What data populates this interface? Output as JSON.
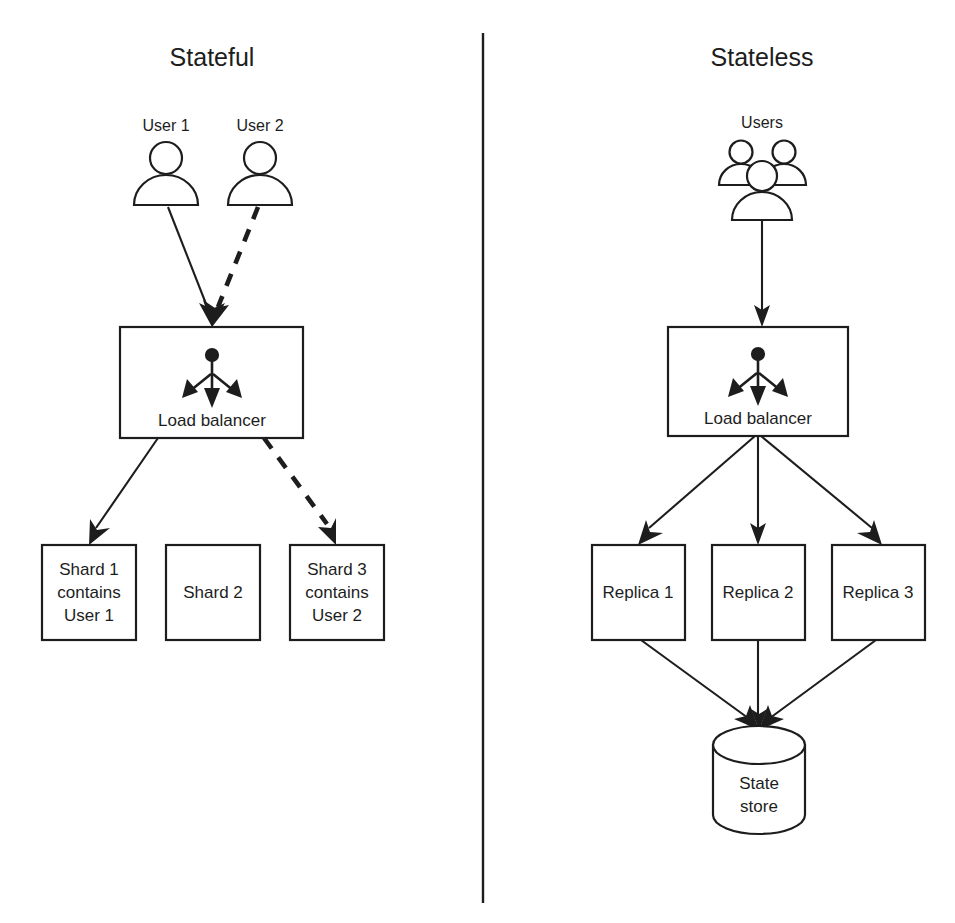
{
  "figure": {
    "background_color": "#ffffff",
    "stroke_color": "#1d1d1d",
    "divider": "vertical-rule"
  },
  "panels": [
    {
      "id": "stateful",
      "heading": "Stateful",
      "actors": [
        {
          "name": "user-1",
          "label": "User 1",
          "icon": "single-user-icon"
        },
        {
          "name": "user-2",
          "label": "User 2",
          "icon": "single-user-icon"
        }
      ],
      "balancer": {
        "label": "Load balancer",
        "icon": "load-balancer-icon"
      },
      "backends": [
        {
          "name": "shard-1",
          "lines": [
            "Shard 1",
            "contains",
            "User 1"
          ]
        },
        {
          "name": "shard-2",
          "lines": [
            "Shard 2"
          ]
        },
        {
          "name": "shard-3",
          "lines": [
            "Shard 3",
            "contains",
            "User 2"
          ]
        }
      ],
      "edges": [
        {
          "from": "User 1",
          "to": "Load balancer",
          "style": "solid"
        },
        {
          "from": "User 2",
          "to": "Load balancer",
          "style": "dashed"
        },
        {
          "from": "Load balancer",
          "to": "Shard 1",
          "style": "solid"
        },
        {
          "from": "Load balancer",
          "to": "Shard 3",
          "style": "dashed"
        }
      ]
    },
    {
      "id": "stateless",
      "heading": "Stateless",
      "actors": [
        {
          "name": "users-group",
          "label": "Users",
          "icon": "users-group-icon"
        }
      ],
      "balancer": {
        "label": "Load balancer",
        "icon": "load-balancer-icon"
      },
      "backends": [
        {
          "name": "replica-1",
          "lines": [
            "Replica 1"
          ]
        },
        {
          "name": "replica-2",
          "lines": [
            "Replica 2"
          ]
        },
        {
          "name": "replica-3",
          "lines": [
            "Replica 3"
          ]
        }
      ],
      "datastore": {
        "name": "state-store",
        "lines": [
          "State",
          "store"
        ],
        "shape": "cylinder"
      },
      "edges": [
        {
          "from": "Users",
          "to": "Load balancer",
          "style": "solid"
        },
        {
          "from": "Load balancer",
          "to": "Replica 1",
          "style": "solid"
        },
        {
          "from": "Load balancer",
          "to": "Replica 2",
          "style": "solid"
        },
        {
          "from": "Load balancer",
          "to": "Replica 3",
          "style": "solid"
        },
        {
          "from": "Replica 1",
          "to": "State store",
          "style": "solid"
        },
        {
          "from": "Replica 2",
          "to": "State store",
          "style": "solid"
        },
        {
          "from": "Replica 3",
          "to": "State store",
          "style": "solid"
        }
      ]
    }
  ]
}
